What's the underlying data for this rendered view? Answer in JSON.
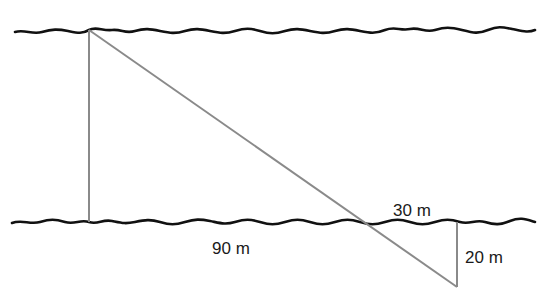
{
  "diagram": {
    "type": "river-width-similar-triangles",
    "banks": [
      "upper-bank",
      "lower-bank"
    ],
    "labels": {
      "ninety": "90 m",
      "thirty": "30 m",
      "twenty": "20 m"
    },
    "colors": {
      "bank": "#111111",
      "construction_line": "#8a8a8a",
      "text": "#1a1a1a",
      "background": "#ffffff"
    }
  }
}
